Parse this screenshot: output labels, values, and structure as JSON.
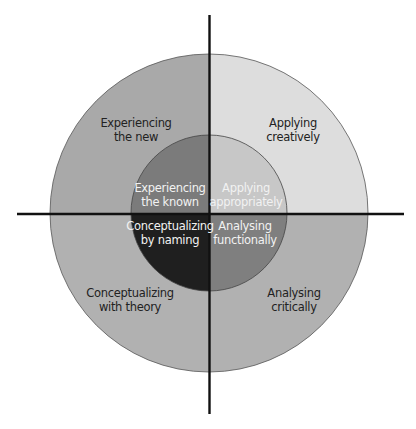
{
  "diagram": {
    "type": "quadrant-concentric-circles",
    "colors": {
      "outer_top_left": "#a9a9a9",
      "outer_top_right": "#dddddd",
      "outer_bottom": "#b1b1b1",
      "inner_top_left": "#7b7b7b",
      "inner_top_right": "#c7c7c7",
      "inner_bottom_left": "#1f1f1f",
      "inner_bottom_right": "#7f7f7f",
      "axis": "#111111"
    },
    "outer_ring": {
      "top_left": {
        "line1": "Experiencing",
        "line2": "the new"
      },
      "top_right": {
        "line1": "Applying",
        "line2": "creatively"
      },
      "bottom_left": {
        "line1": "Conceptualizing",
        "line2": "with theory"
      },
      "bottom_right": {
        "line1": "Analysing",
        "line2": "critically"
      }
    },
    "inner_circle": {
      "top_left": {
        "line1": "Experiencing",
        "line2": "the known"
      },
      "top_right": {
        "line1": "Applying",
        "line2": "appropriately"
      },
      "bottom_left": {
        "line1": "Conceptualizing",
        "line2": "by naming"
      },
      "bottom_right": {
        "line1": "Analysing",
        "line2": "functionally"
      }
    }
  }
}
